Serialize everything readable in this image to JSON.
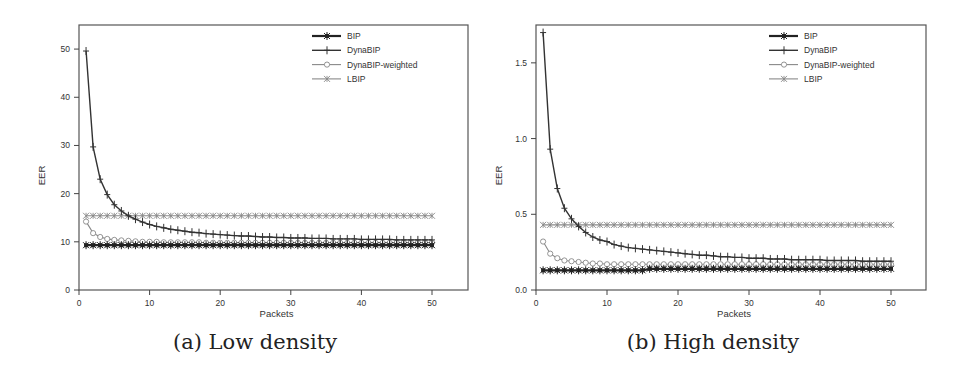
{
  "chart_data": [
    {
      "type": "line",
      "title": "",
      "caption": "(a) Low density",
      "xlabel": "Packets",
      "ylabel": "EER",
      "xlim": [
        0,
        55
      ],
      "ylim": [
        0,
        55
      ],
      "xticks": [
        0,
        10,
        20,
        30,
        40,
        50
      ],
      "yticks": [
        0,
        10,
        20,
        30,
        40,
        50
      ],
      "grid": false,
      "legend_position": "upper right",
      "x": [
        1,
        2,
        3,
        4,
        5,
        6,
        7,
        8,
        9,
        10,
        11,
        12,
        13,
        14,
        15,
        16,
        17,
        18,
        19,
        20,
        21,
        22,
        23,
        24,
        25,
        26,
        27,
        28,
        29,
        30,
        31,
        32,
        33,
        34,
        35,
        36,
        37,
        38,
        39,
        40,
        41,
        42,
        43,
        44,
        45,
        46,
        47,
        48,
        49,
        50
      ],
      "series": [
        {
          "name": "BIP",
          "marker": "asterisk-filled",
          "color": "#222222",
          "width": 2.2,
          "values": [
            9.3,
            9.3,
            9.3,
            9.3,
            9.3,
            9.3,
            9.3,
            9.3,
            9.3,
            9.3,
            9.3,
            9.3,
            9.3,
            9.3,
            9.3,
            9.3,
            9.3,
            9.3,
            9.3,
            9.3,
            9.3,
            9.3,
            9.3,
            9.3,
            9.3,
            9.3,
            9.3,
            9.3,
            9.3,
            9.3,
            9.3,
            9.3,
            9.3,
            9.3,
            9.3,
            9.3,
            9.3,
            9.3,
            9.3,
            9.3,
            9.3,
            9.3,
            9.3,
            9.3,
            9.3,
            9.3,
            9.3,
            9.3,
            9.3,
            9.3
          ]
        },
        {
          "name": "DynaBIP",
          "marker": "plus",
          "color": "#333333",
          "width": 1.4,
          "values": [
            49.6,
            29.7,
            23.0,
            19.8,
            17.7,
            16.4,
            15.4,
            14.7,
            14.1,
            13.6,
            13.2,
            12.9,
            12.6,
            12.4,
            12.2,
            12.0,
            11.9,
            11.7,
            11.6,
            11.5,
            11.4,
            11.3,
            11.2,
            11.2,
            11.1,
            11.0,
            11.0,
            10.9,
            10.9,
            10.8,
            10.8,
            10.8,
            10.7,
            10.7,
            10.7,
            10.6,
            10.6,
            10.6,
            10.6,
            10.5,
            10.5,
            10.5,
            10.5,
            10.5,
            10.4,
            10.4,
            10.4,
            10.4,
            10.4,
            10.4
          ]
        },
        {
          "name": "DynaBIP-weighted",
          "marker": "circle",
          "color": "#888888",
          "width": 1.1,
          "values": [
            14.2,
            11.8,
            11.0,
            10.6,
            10.4,
            10.3,
            10.2,
            10.1,
            10.0,
            10.0,
            10.0,
            9.9,
            9.9,
            9.9,
            9.9,
            9.9,
            9.9,
            9.8,
            9.8,
            9.8,
            9.8,
            9.8,
            9.8,
            9.8,
            9.8,
            9.8,
            9.8,
            9.8,
            9.8,
            9.8,
            9.8,
            9.8,
            9.8,
            9.8,
            9.8,
            9.8,
            9.8,
            9.8,
            9.8,
            9.8,
            9.8,
            9.8,
            9.8,
            9.8,
            9.8,
            9.8,
            9.8,
            9.8,
            9.8,
            9.8
          ]
        },
        {
          "name": "LBIP",
          "marker": "x",
          "color": "#888888",
          "width": 1.1,
          "values": [
            15.4,
            15.4,
            15.4,
            15.4,
            15.4,
            15.4,
            15.4,
            15.4,
            15.4,
            15.4,
            15.4,
            15.4,
            15.4,
            15.4,
            15.4,
            15.4,
            15.4,
            15.4,
            15.4,
            15.4,
            15.4,
            15.4,
            15.4,
            15.4,
            15.4,
            15.4,
            15.4,
            15.4,
            15.4,
            15.4,
            15.4,
            15.4,
            15.4,
            15.4,
            15.4,
            15.4,
            15.4,
            15.4,
            15.4,
            15.4,
            15.4,
            15.4,
            15.4,
            15.4,
            15.4,
            15.4,
            15.4,
            15.4,
            15.4,
            15.4
          ]
        }
      ]
    },
    {
      "type": "line",
      "title": "",
      "caption": "(b) High density",
      "xlabel": "Packets",
      "ylabel": "EER",
      "xlim": [
        0,
        55
      ],
      "ylim": [
        0,
        1.75
      ],
      "xticks": [
        0,
        10,
        20,
        30,
        40,
        50
      ],
      "yticks": [
        0.0,
        0.5,
        1.0,
        1.5
      ],
      "ytick_labels": [
        "0.0",
        "0.5",
        "1.0",
        "1.5"
      ],
      "grid": false,
      "legend_position": "upper right",
      "x": [
        1,
        2,
        3,
        4,
        5,
        6,
        7,
        8,
        9,
        10,
        11,
        12,
        13,
        14,
        15,
        16,
        17,
        18,
        19,
        20,
        21,
        22,
        23,
        24,
        25,
        26,
        27,
        28,
        29,
        30,
        31,
        32,
        33,
        34,
        35,
        36,
        37,
        38,
        39,
        40,
        41,
        42,
        43,
        44,
        45,
        46,
        47,
        48,
        49,
        50
      ],
      "series": [
        {
          "name": "BIP",
          "marker": "asterisk-filled",
          "color": "#222222",
          "width": 2.2,
          "values": [
            0.13,
            0.13,
            0.13,
            0.13,
            0.13,
            0.13,
            0.13,
            0.13,
            0.13,
            0.13,
            0.13,
            0.13,
            0.13,
            0.13,
            0.13,
            0.14,
            0.14,
            0.14,
            0.14,
            0.14,
            0.14,
            0.14,
            0.14,
            0.14,
            0.14,
            0.14,
            0.14,
            0.14,
            0.14,
            0.14,
            0.14,
            0.14,
            0.14,
            0.14,
            0.14,
            0.14,
            0.14,
            0.14,
            0.14,
            0.14,
            0.14,
            0.14,
            0.14,
            0.14,
            0.14,
            0.14,
            0.14,
            0.14,
            0.14,
            0.14
          ]
        },
        {
          "name": "DynaBIP",
          "marker": "plus",
          "color": "#333333",
          "width": 1.4,
          "values": [
            1.7,
            0.93,
            0.67,
            0.54,
            0.47,
            0.42,
            0.38,
            0.35,
            0.33,
            0.32,
            0.3,
            0.29,
            0.28,
            0.275,
            0.27,
            0.265,
            0.26,
            0.255,
            0.25,
            0.245,
            0.24,
            0.235,
            0.23,
            0.23,
            0.225,
            0.22,
            0.22,
            0.215,
            0.215,
            0.21,
            0.21,
            0.21,
            0.205,
            0.205,
            0.205,
            0.2,
            0.2,
            0.2,
            0.2,
            0.2,
            0.195,
            0.195,
            0.195,
            0.195,
            0.195,
            0.19,
            0.19,
            0.19,
            0.19,
            0.19
          ]
        },
        {
          "name": "DynaBIP-weighted",
          "marker": "circle",
          "color": "#888888",
          "width": 1.1,
          "values": [
            0.32,
            0.24,
            0.21,
            0.195,
            0.19,
            0.185,
            0.18,
            0.175,
            0.175,
            0.17,
            0.17,
            0.17,
            0.17,
            0.17,
            0.17,
            0.17,
            0.17,
            0.17,
            0.17,
            0.17,
            0.17,
            0.17,
            0.17,
            0.17,
            0.17,
            0.17,
            0.17,
            0.17,
            0.17,
            0.17,
            0.17,
            0.17,
            0.17,
            0.17,
            0.17,
            0.17,
            0.17,
            0.17,
            0.17,
            0.17,
            0.17,
            0.17,
            0.17,
            0.17,
            0.17,
            0.17,
            0.17,
            0.17,
            0.17,
            0.17
          ]
        },
        {
          "name": "LBIP",
          "marker": "x",
          "color": "#888888",
          "width": 1.1,
          "values": [
            0.43,
            0.43,
            0.43,
            0.43,
            0.43,
            0.43,
            0.43,
            0.43,
            0.43,
            0.43,
            0.43,
            0.43,
            0.43,
            0.43,
            0.43,
            0.43,
            0.43,
            0.43,
            0.43,
            0.43,
            0.43,
            0.43,
            0.43,
            0.43,
            0.43,
            0.43,
            0.43,
            0.43,
            0.43,
            0.43,
            0.43,
            0.43,
            0.43,
            0.43,
            0.43,
            0.43,
            0.43,
            0.43,
            0.43,
            0.43,
            0.43,
            0.43,
            0.43,
            0.43,
            0.43,
            0.43,
            0.43,
            0.43,
            0.43,
            0.43
          ]
        }
      ]
    }
  ],
  "layout": [
    {
      "frame": {
        "left": 79,
        "top": 25,
        "right": 468,
        "bottom": 290
      },
      "x0px": 79,
      "x50px": 432,
      "legend": {
        "x": 312,
        "y": 36
      }
    },
    {
      "frame": {
        "left": 536,
        "top": 25,
        "right": 926,
        "bottom": 290
      },
      "x0px": 536,
      "x50px": 891,
      "legend": {
        "x": 769,
        "y": 36
      }
    }
  ]
}
